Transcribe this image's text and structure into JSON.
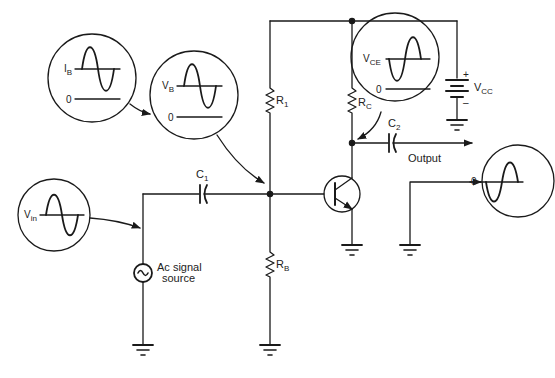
{
  "diagram": {
    "type": "common-emitter BJT amplifier schematic",
    "stroke_color": "#1a1a1a",
    "background": "#ffffff",
    "labels": {
      "r1": {
        "main": "R",
        "sub": "1"
      },
      "rc": {
        "main": "R",
        "sub": "C"
      },
      "rb": {
        "main": "R",
        "sub": "B"
      },
      "c1": {
        "main": "C",
        "sub": "1"
      },
      "c2": {
        "main": "C",
        "sub": "2"
      },
      "vcc": {
        "main": "V",
        "sub": "CC"
      },
      "vcc_plus": "+",
      "vcc_minus": "–",
      "output": "Output",
      "ac_source_line1": "Ac signal",
      "ac_source_line2": "source"
    },
    "waveform_insets": [
      {
        "id": "ib",
        "label": {
          "main": "I",
          "sub": "B"
        },
        "zero_label": "0",
        "phase": "in-phase"
      },
      {
        "id": "vb",
        "label": {
          "main": "V",
          "sub": "B"
        },
        "zero_label": "0",
        "phase": "in-phase"
      },
      {
        "id": "vin",
        "label": {
          "main": "V",
          "sub": "in"
        },
        "phase": "in-phase"
      },
      {
        "id": "vce",
        "label": {
          "main": "V",
          "sub": "CE"
        },
        "zero_label": "0",
        "phase": "inverted"
      },
      {
        "id": "vout",
        "zero_label": "0",
        "phase": "inverted"
      }
    ],
    "components": [
      "R1",
      "RC",
      "RB",
      "C1",
      "C2",
      "VCC battery",
      "NPN transistor",
      "Ac signal source",
      "ground x4"
    ]
  }
}
